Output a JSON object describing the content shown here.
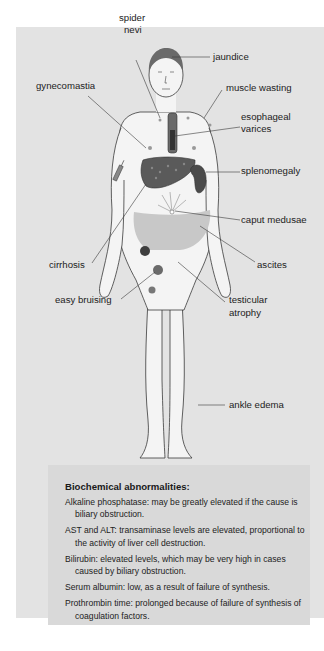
{
  "figure": {
    "labels": {
      "spider_nevi": "spider\nnevi",
      "spider": "spider",
      "nevi": "nevi",
      "jaundice": "jaundice",
      "gynecomastia": "gynecomastia",
      "muscle_wasting": "muscle wasting",
      "esophageal": "esophageal",
      "varices": "varices",
      "splenomegaly": "splenomegaly",
      "caput_medusae": "caput medusae",
      "cirrhosis": "cirrhosis",
      "ascites": "ascites",
      "easy_bruising": "easy bruising",
      "testicular": "testicular",
      "atrophy": "atrophy",
      "ankle_edema": "ankle edema"
    },
    "colors": {
      "panel_bg": "#e3e3e3",
      "textbox_bg": "#d9d9d9",
      "skin": "#f2f2f2",
      "outline": "#3a3a3a",
      "organ_dark": "#555555",
      "ascites_fill": "#c4c4c4",
      "bruise": "#4a4a4a"
    }
  },
  "biochem": {
    "title": "Biochemical abnormalities:",
    "items": [
      "Alkaline phosphatase: may be greatly elevated if the cause is biliary obstruction.",
      "AST and ALT: transaminase levels are elevated, proportional to the activity of liver cell destruction.",
      "Bilirubin: elevated levels, which may be very high in cases caused by biliary obstruction.",
      "Serum albumin: low, as a result of failure of synthesis.",
      "Prothrombin time: prolonged because of failure of synthesis of coagulation factors."
    ]
  }
}
